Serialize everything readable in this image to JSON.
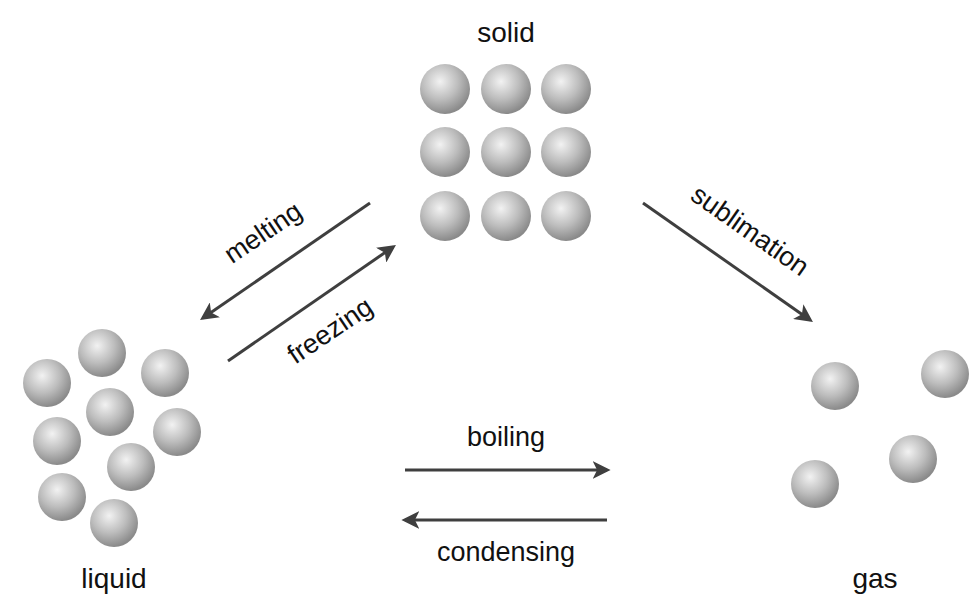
{
  "diagram": {
    "colors": {
      "arrow": "#3f3f3f",
      "text": "#111111",
      "sphere_light": "#f2f2f2",
      "sphere_mid": "#bdbdbd",
      "sphere_dark": "#8a8a8a"
    },
    "states": {
      "solid": {
        "label": "solid",
        "label_pos": [
          506,
          42
        ],
        "spheres": [
          [
            445,
            89
          ],
          [
            506,
            89
          ],
          [
            566,
            89
          ],
          [
            445,
            152
          ],
          [
            506,
            152
          ],
          [
            566,
            152
          ],
          [
            445,
            216
          ],
          [
            506,
            216
          ],
          [
            566,
            216
          ]
        ],
        "radius": 25
      },
      "liquid": {
        "label": "liquid",
        "label_pos": [
          114,
          588
        ],
        "spheres": [
          [
            47,
            383
          ],
          [
            102,
            353
          ],
          [
            165,
            373
          ],
          [
            110,
            412
          ],
          [
            57,
            441
          ],
          [
            177,
            432
          ],
          [
            131,
            467
          ],
          [
            62,
            497
          ],
          [
            114,
            523
          ]
        ],
        "radius": 24
      },
      "gas": {
        "label": "gas",
        "label_pos": [
          875,
          588
        ],
        "spheres": [
          [
            835,
            386
          ],
          [
            945,
            374
          ],
          [
            913,
            459
          ],
          [
            815,
            484
          ]
        ],
        "radius": 24
      }
    },
    "transitions": {
      "melting": {
        "label": "melting",
        "from": [
          370,
          203
        ],
        "to": [
          203,
          318
        ],
        "label_pos": [
          268,
          240
        ],
        "angle": -34
      },
      "freezing": {
        "label": "freezing",
        "from": [
          228,
          361
        ],
        "to": [
          393,
          247
        ],
        "label_pos": [
          335,
          338
        ],
        "angle": -34
      },
      "sublimation": {
        "label": "sublimation",
        "from": [
          643,
          203
        ],
        "to": [
          810,
          320
        ],
        "label_pos": [
          745,
          238
        ],
        "angle": 35
      },
      "boiling": {
        "label": "boiling",
        "from": [
          405,
          470
        ],
        "to": [
          607,
          470
        ],
        "label_pos": [
          506,
          446
        ]
      },
      "condensing": {
        "label": "condensing",
        "from": [
          607,
          520
        ],
        "to": [
          405,
          520
        ],
        "label_pos": [
          506,
          561
        ]
      }
    }
  }
}
